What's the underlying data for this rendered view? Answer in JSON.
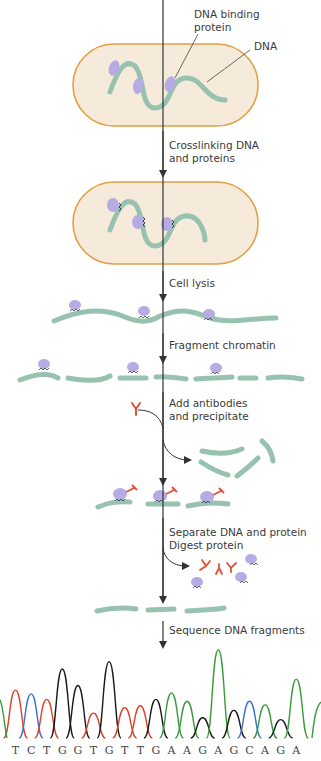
{
  "figure": {
    "labels": {
      "dna_binding_protein_1": "DNA binding",
      "dna_binding_protein_2": "protein",
      "dna": "DNA"
    },
    "steps": [
      {
        "line1": "Crosslinking DNA",
        "line2": "and proteins"
      },
      {
        "line1": "Cell lysis",
        "line2": ""
      },
      {
        "line1": "Fragment chromatin",
        "line2": ""
      },
      {
        "line1": "Add antibodies",
        "line2": "and precipitate"
      },
      {
        "line1": "Separate DNA and protein",
        "line2": "Digest protein"
      },
      {
        "line1": "Sequence DNA fragments",
        "line2": ""
      }
    ],
    "colors": {
      "cell_fill": "#f6eadb",
      "cell_border": "#e2a045",
      "dna": "#97c2b0",
      "protein": "#b6abe2",
      "antibody": "#e0503a",
      "arrow": "#333333",
      "base_A": "#3a9a3a",
      "base_C": "#3b6fd0",
      "base_G": "#1a1a1a",
      "base_T": "#e0402a"
    }
  },
  "chart_data": {
    "type": "line",
    "xlabel": "",
    "ylabel": "",
    "grid": false,
    "sequence": [
      "T",
      "C",
      "T",
      "G",
      "G",
      "T",
      "G",
      "T",
      "T",
      "G",
      "A",
      "A",
      "G",
      "A",
      "G",
      "C",
      "A",
      "G",
      "A"
    ],
    "categories": [
      "T",
      "C",
      "T",
      "G",
      "G",
      "T",
      "G",
      "T",
      "T",
      "G",
      "A",
      "A",
      "G",
      "A",
      "G",
      "C",
      "A",
      "G",
      "A"
    ],
    "peak_heights": [
      52,
      48,
      42,
      75,
      57,
      27,
      83,
      33,
      35,
      42,
      49,
      40,
      22,
      96,
      30,
      40,
      36,
      20,
      64
    ],
    "series": [
      {
        "name": "A",
        "color": "#3a9a3a"
      },
      {
        "name": "C",
        "color": "#3b6fd0"
      },
      {
        "name": "G",
        "color": "#1a1a1a"
      },
      {
        "name": "T",
        "color": "#e0402a"
      }
    ],
    "ylim": [
      0,
      100
    ]
  }
}
